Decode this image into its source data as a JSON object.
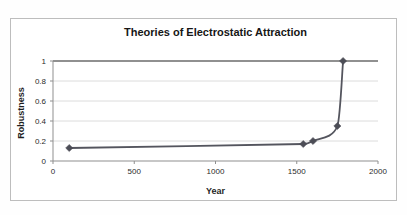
{
  "chart_data": {
    "type": "line",
    "title": "Theories of Electrostatic Attraction",
    "xlabel": "Year",
    "ylabel": "Robustness",
    "x": [
      100,
      1540,
      1600,
      1750,
      1785
    ],
    "y": [
      0.13,
      0.17,
      0.2,
      0.35,
      1.0
    ],
    "xlim": [
      0,
      2000
    ],
    "ylim": [
      0,
      1
    ],
    "x_ticks": [
      0,
      500,
      1000,
      1500,
      2000
    ],
    "y_ticks": [
      0,
      0.2,
      0.4,
      0.6,
      0.8,
      1
    ],
    "grid": true,
    "legend": "none",
    "line_smooth": true,
    "marker": "diamond",
    "reference_line_y": 1.0,
    "colors": {
      "series": "#54555e",
      "marker": "#4c4d56",
      "gridline": "#dcdcdc",
      "reference_line": "#6b6b6b",
      "axis": "#8f8f8f",
      "tick_text": "#2b2b2b",
      "title_text": "#161616",
      "frame_border": "#bdbdbd",
      "background": "#ffffff"
    }
  }
}
